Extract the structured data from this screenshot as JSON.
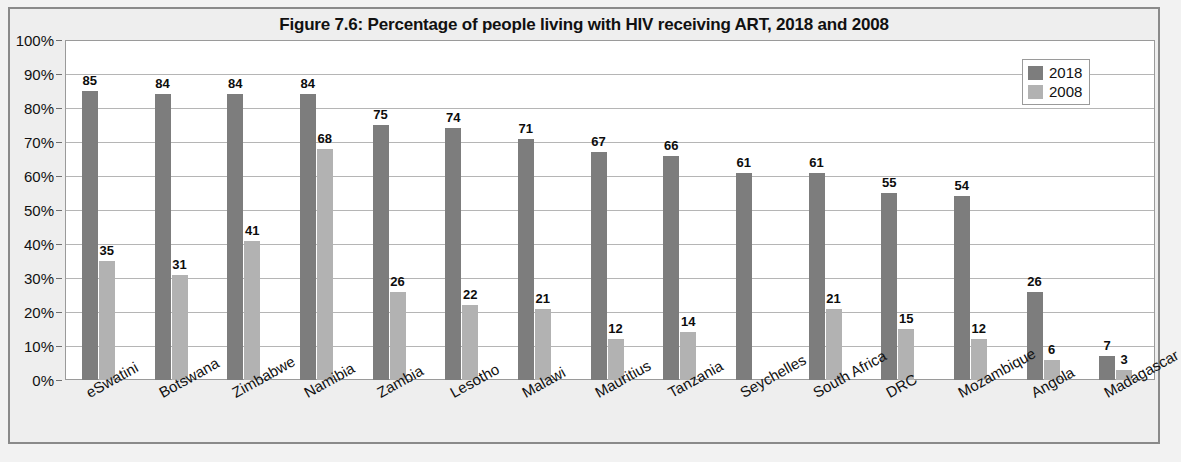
{
  "chart_data": {
    "type": "bar",
    "title": "Figure 7.6: Percentage of people living with HIV receiving ART, 2018 and 2008",
    "xlabel": "",
    "ylabel": "",
    "ylim": [
      0,
      100
    ],
    "ytick_labels": [
      "100%",
      "90%",
      "80%",
      "70%",
      "60%",
      "50%",
      "40%",
      "30%",
      "20%",
      "10%",
      "0%"
    ],
    "ytick_values": [
      100,
      90,
      80,
      70,
      60,
      50,
      40,
      30,
      20,
      10,
      0
    ],
    "grid": true,
    "legend_position": "top-right",
    "categories": [
      "eSwatini",
      "Botswana",
      "Zimbabwe",
      "Namibia",
      "Zambia",
      "Lesotho",
      "Malawi",
      "Mauritius",
      "Tanzania",
      "Seychelles",
      "South Africa",
      "DRC",
      "Mozambique",
      "Angola",
      "Madagascar"
    ],
    "series": [
      {
        "name": "2018",
        "color": "#7d7d7d",
        "values": [
          85,
          84,
          84,
          84,
          75,
          74,
          71,
          67,
          66,
          61,
          61,
          55,
          54,
          26,
          7
        ]
      },
      {
        "name": "2008",
        "color": "#b2b2b2",
        "values": [
          35,
          31,
          41,
          68,
          26,
          22,
          21,
          12,
          14,
          null,
          21,
          15,
          12,
          6,
          3
        ]
      }
    ]
  },
  "legend": {
    "entries": [
      {
        "label": "2018",
        "color": "#7d7d7d"
      },
      {
        "label": "2008",
        "color": "#b2b2b2"
      }
    ]
  }
}
